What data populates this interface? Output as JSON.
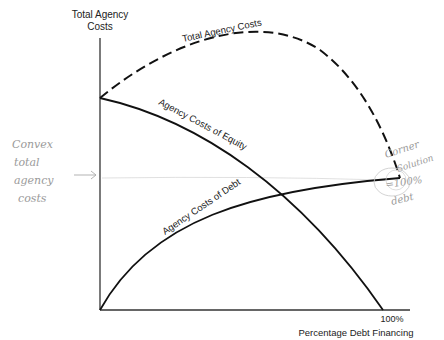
{
  "axes": {
    "y_label_line1": "Total Agency",
    "y_label_line2": "Costs",
    "x_label": "Percentage Debt Financing",
    "x_tick": "100%"
  },
  "curves": {
    "total": "Total Agency Costs",
    "equity": "Agency Costs of Equity",
    "debt": "Agency Costs of Debt"
  },
  "annotations": {
    "left_note": [
      "Convex",
      "total",
      "agency",
      "costs"
    ],
    "right_note": [
      "Corner",
      "Solution",
      "=100%",
      "debt"
    ]
  },
  "colors": {
    "ink": "#111111",
    "pencil": "#9a9a9a",
    "axis": "#333333"
  }
}
